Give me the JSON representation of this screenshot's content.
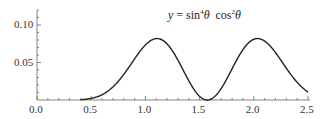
{
  "chart_data": {
    "type": "line",
    "title_parts": {
      "lhs": "y",
      "eq": " = ",
      "sin": "sin",
      "sin_exp": "4",
      "theta1": "θ",
      "cos": "cos",
      "cos_exp": "2",
      "theta2": "θ"
    },
    "xlabel": "",
    "ylabel": "",
    "xlim": [
      0.0,
      2.5
    ],
    "ylim": [
      0.0,
      0.12
    ],
    "x_ticks": [
      "0.0",
      "0.5",
      "1.0",
      "1.5",
      "2.0",
      "2.5"
    ],
    "y_ticks": [
      "0.05",
      "0.10"
    ],
    "grid": false,
    "legend": null,
    "series": [
      {
        "name": "y",
        "color": "#222222",
        "x": [
          0.4,
          0.5,
          0.6,
          0.7,
          0.8,
          0.9,
          1.0,
          1.1,
          1.2,
          1.3,
          1.4,
          1.5,
          1.571,
          1.6,
          1.7,
          1.8,
          1.9,
          2.0,
          2.1,
          2.2,
          2.3,
          2.4,
          2.5
        ],
        "y": [
          0.0006,
          0.0021,
          0.0057,
          0.0127,
          0.0238,
          0.0385,
          0.0551,
          0.0709,
          0.0812,
          0.081,
          0.0665,
          0.0324,
          0.0,
          0.0008,
          0.0165,
          0.0474,
          0.0741,
          0.0819,
          0.0702,
          0.0506,
          0.0318,
          0.0182,
          0.0106
        ]
      }
    ]
  }
}
